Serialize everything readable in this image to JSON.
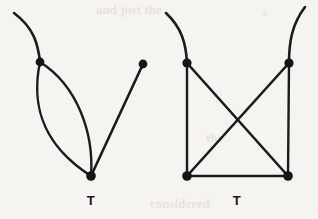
{
  "canvas": {
    "width": 318,
    "height": 219,
    "background_color": "#f6f4f0",
    "ink_color": "#1b1a1e"
  },
  "figure_type": "tangle-diagram-pair",
  "figures": [
    {
      "id": "left-tangle",
      "label": "T",
      "label_x": 91,
      "label_y": 194,
      "description": "Bigon (lens) tangle with a free strand",
      "vertices": [
        {
          "name": "upper-left-vertex",
          "x": 40,
          "y": 62,
          "r": 4.4
        },
        {
          "name": "bottom-vertex",
          "x": 91,
          "y": 176,
          "r": 4.8
        },
        {
          "name": "upper-right-endpoint",
          "x": 143,
          "y": 64,
          "r": 4.4
        }
      ],
      "strands": [
        {
          "name": "free-strand-upper-left",
          "kind": "curve",
          "path": "M 40 62 C 38 44 34 28 14 13",
          "width": 2.6
        },
        {
          "name": "bigon-left-arc",
          "kind": "curve",
          "path": "M 40 62 C 32 100 38 142 91 176",
          "width": 2.4
        },
        {
          "name": "bigon-right-arc",
          "kind": "curve",
          "path": "M 40 62 C 78 86 94 134 91 176",
          "width": 2.4
        },
        {
          "name": "straight-strand-to-right-endpoint",
          "kind": "line",
          "path": "M 91 176 L 143 64",
          "width": 2.6
        }
      ]
    },
    {
      "id": "right-tangle",
      "label": "T",
      "label_x": 237,
      "label_y": 194,
      "description": "Square tangle with both diagonals crossing, open at top",
      "vertices": [
        {
          "name": "top-left-corner",
          "x": 187,
          "y": 63,
          "r": 4.6
        },
        {
          "name": "top-right-corner",
          "x": 289,
          "y": 63,
          "r": 4.6
        },
        {
          "name": "bottom-left-corner",
          "x": 187,
          "y": 176,
          "r": 4.8
        },
        {
          "name": "bottom-right-corner",
          "x": 288,
          "y": 176,
          "r": 4.8
        }
      ],
      "strands": [
        {
          "name": "free-strand-upper-left",
          "kind": "curve",
          "path": "M 187 63 C 186 44 182 28 166 13",
          "width": 2.6
        },
        {
          "name": "free-strand-upper-right",
          "kind": "curve",
          "path": "M 289 63 C 289 42 292 24 305 7",
          "width": 2.6
        },
        {
          "name": "left-edge",
          "kind": "line",
          "path": "M 187 63 L 187 176",
          "width": 2.4
        },
        {
          "name": "right-edge",
          "kind": "line",
          "path": "M 289 63 L 288 176",
          "width": 2.4
        },
        {
          "name": "bottom-edge",
          "kind": "line",
          "path": "M 187 176 L 288 176",
          "width": 2.6
        },
        {
          "name": "diagonal-top-left-to-bottom-right",
          "kind": "line",
          "path": "M 187 63 L 288 176",
          "width": 2.6
        },
        {
          "name": "diagonal-top-right-to-bottom-left",
          "kind": "line",
          "path": "M 289 63 L 187 176",
          "width": 2.6
        }
      ]
    }
  ],
  "scan_artifacts": [
    {
      "text": "and just the",
      "x": 96,
      "y": 2
    },
    {
      "text": "s",
      "x": 262,
      "y": 4
    },
    {
      "text": "the",
      "x": 206,
      "y": 130
    },
    {
      "text": "considered",
      "x": 150,
      "y": 196
    }
  ]
}
